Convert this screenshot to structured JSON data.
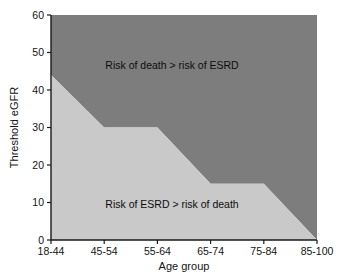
{
  "chart_data": {
    "type": "area",
    "title": "",
    "xlabel": "Age group",
    "ylabel": "Threshold eGFR",
    "categories": [
      "18-44",
      "45-54",
      "55-64",
      "65-74",
      "75-84",
      "85-100"
    ],
    "x_tick_labels": [
      "18-44",
      "45-54",
      "55-64",
      "65-74",
      "75-84",
      "85-100"
    ],
    "y_tick_labels": [
      "0",
      "10",
      "20",
      "30",
      "40",
      "50",
      "60"
    ],
    "y_tick_values": [
      0,
      10,
      20,
      30,
      40,
      50,
      60
    ],
    "ylim": [
      0,
      60
    ],
    "grid": false,
    "legend_position": "none",
    "boundary_series": {
      "name": "Threshold eGFR boundary",
      "values": [
        44,
        30,
        30,
        15,
        15,
        0
      ]
    },
    "regions": [
      {
        "name": "upper-region",
        "label": "Risk of death > risk of ESRD",
        "color": "#7d7d7d",
        "label_x_fraction": 0.455,
        "label_y_value": 46.5
      },
      {
        "name": "lower-region",
        "label": "Risk of ESRD > risk of death",
        "color": "#c9c9c9",
        "label_x_fraction": 0.455,
        "label_y_value": 9.5
      }
    ],
    "colors": {
      "upper_fill": "#7d7d7d",
      "lower_fill": "#c9c9c9",
      "axis": "#1a1a1a",
      "text": "#141414",
      "background": "#ffffff"
    }
  },
  "annotations": {
    "upper_region_text": "Risk of death > risk of ESRD",
    "lower_region_text": "Risk of ESRD > risk of death"
  },
  "axes": {
    "x_title": "Age group",
    "y_title": "Threshold eGFR"
  }
}
